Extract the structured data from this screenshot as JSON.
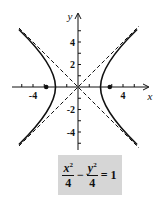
{
  "figure": {
    "type": "hyperbola-graph",
    "axes": {
      "x_label": "x",
      "y_label": "y",
      "x_ticks_labeled": [
        "-4",
        "4"
      ],
      "y_ticks_labeled": [
        "4",
        "2",
        "-2",
        "-4"
      ]
    },
    "equation": {
      "term1_num": "x",
      "term1_exp": "2",
      "term1_den": "4",
      "operator": "−",
      "term2_num": "y",
      "term2_exp": "2",
      "term2_den": "4",
      "equals": "= 1"
    },
    "curve": "x^2/4 - y^2/4 = 1",
    "asymptotes": [
      "y = x",
      "y = -x"
    ],
    "foci": [
      "(-2√2, 0)",
      "(2√2, 0)"
    ],
    "vertices": [
      "(-2, 0)",
      "(2, 0)"
    ],
    "colors": {
      "curve": "#111111",
      "equation_box": "#d6d6d6"
    }
  }
}
